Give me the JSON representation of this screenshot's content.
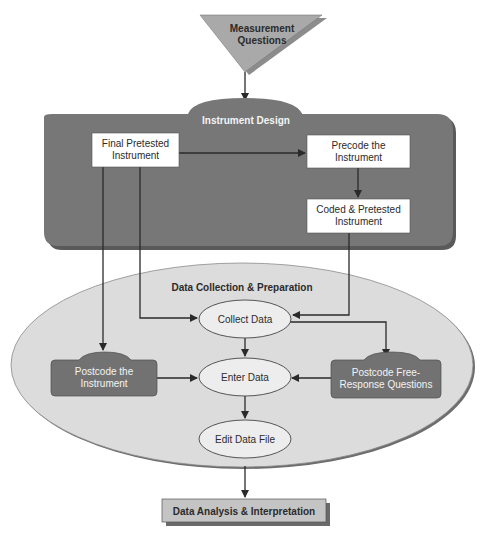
{
  "diagram": {
    "start": {
      "line1": "Measurement",
      "line2": "Questions"
    },
    "instrument_design": {
      "title": "Instrument Design",
      "final_pretested": {
        "line1": "Final Pretested",
        "line2": "Instrument"
      },
      "precode": {
        "line1": "Precode the",
        "line2": "Instrument"
      },
      "coded_pretested": {
        "line1": "Coded & Pretested",
        "line2": "Instrument"
      }
    },
    "data_collection": {
      "title": "Data Collection & Preparation",
      "collect": "Collect Data",
      "enter": "Enter Data",
      "edit": "Edit Data File",
      "postcode_instrument": {
        "line1": "Postcode the",
        "line2": "Instrument"
      },
      "postcode_free": {
        "line1": "Postcode Free-",
        "line2": "Response Questions"
      }
    },
    "end": {
      "label": "Data Analysis & Interpretation"
    }
  },
  "colors": {
    "triangle": "#a9a9a9",
    "container_dark": "#777777",
    "ellipse_light": "#dcdcdc",
    "box_white": "#ffffff",
    "node_ellipse": "#ededed",
    "postcode_box": "#727272",
    "end_box": "#c4c4c4"
  }
}
